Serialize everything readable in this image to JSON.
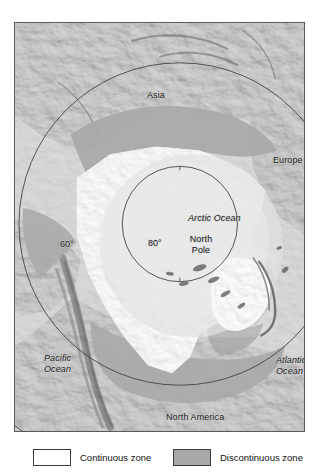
{
  "figure": {
    "projection": "polar-azimuthal-north"
  },
  "map": {
    "center_label": "North Pole",
    "labels": {
      "asia": "Asia",
      "europe": "Europe",
      "arctic_ocean": "Arctic Ocean",
      "north_pole": "North\nPole",
      "north_pole_line1": "North",
      "north_pole_line2": "Pole",
      "latitude_80": "80°",
      "latitude_60": "60°",
      "pacific_ocean_line1": "Pacific",
      "pacific_ocean_line2": "Ocean",
      "atlantic_ocean_line1": "Atlantic",
      "atlantic_ocean_line2": "Ocean",
      "north_america": "North America"
    },
    "graticule": {
      "circles": [
        {
          "label": "80°",
          "latitude": 80
        },
        {
          "label": "60°",
          "latitude": 60
        }
      ]
    },
    "colors": {
      "ocean": "#cfcfcf",
      "land_light": "#c8c8c8",
      "continuous_zone": "#ffffff",
      "discontinuous_zone": "#a9a9a9",
      "frame_border": "#5a5a5a",
      "label_text": "#1b1b1b"
    }
  },
  "legend": {
    "items": [
      {
        "label": "Continuous zone",
        "swatch": "#ffffff",
        "key": "continuous"
      },
      {
        "label": "Discontinuous zone",
        "swatch": "#a9a9a9",
        "key": "discontinuous"
      }
    ]
  }
}
